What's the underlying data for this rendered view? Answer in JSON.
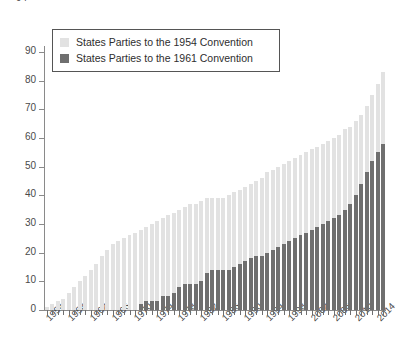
{
  "chart_data": {
    "type": "bar",
    "barmode": "stacked",
    "title": "",
    "xlabel": "",
    "ylabel": "",
    "ylim": [
      0,
      90
    ],
    "yticks": [
      0,
      10,
      20,
      30,
      40,
      50,
      60,
      70,
      80,
      90
    ],
    "y_axis_clipped_top_label": "94",
    "grid": false,
    "legend_position": "top-left",
    "colors": {
      "series_1954": "#e2e2e2",
      "series_1961": "#6f6f6f",
      "axis": "#8a8a8a",
      "text": "#3a3a3a"
    },
    "x": [
      1954,
      1955,
      1956,
      1957,
      1958,
      1959,
      1960,
      1961,
      1962,
      1963,
      1964,
      1965,
      1966,
      1967,
      1968,
      1969,
      1970,
      1971,
      1972,
      1973,
      1974,
      1975,
      1976,
      1977,
      1978,
      1979,
      1980,
      1981,
      1982,
      1983,
      1984,
      1985,
      1986,
      1987,
      1988,
      1989,
      1990,
      1991,
      1992,
      1993,
      1994,
      1995,
      1996,
      1997,
      1998,
      1999,
      2000,
      2001,
      2002,
      2003,
      2004,
      2005,
      2006,
      2007,
      2008,
      2009,
      2010,
      2011,
      2012,
      2013,
      2014,
      2015
    ],
    "xtick_labels": [
      "1954",
      "1958",
      "1962",
      "1966",
      "1970",
      "1974",
      "1978",
      "1982",
      "1986",
      "1990",
      "1994",
      "1998",
      "2002",
      "2006",
      "2010",
      "2014"
    ],
    "xtick_values": [
      1954,
      1958,
      1962,
      1966,
      1970,
      1974,
      1978,
      1982,
      1986,
      1990,
      1994,
      1998,
      2002,
      2006,
      2010,
      2014
    ],
    "series": [
      {
        "name": "States Parties to the 1961 Convention",
        "color": "#6f6f6f",
        "values": [
          0,
          0,
          0,
          0,
          0,
          0,
          0,
          0,
          0,
          0,
          0,
          0,
          0,
          0,
          0,
          0,
          0,
          2,
          3,
          3,
          3,
          5,
          5,
          6,
          8,
          9,
          9,
          9,
          10,
          13,
          14,
          14,
          14,
          14,
          15,
          16,
          17,
          18,
          19,
          19,
          20,
          21,
          22,
          23,
          24,
          25,
          26,
          27,
          28,
          29,
          30,
          31,
          32,
          33,
          35,
          37,
          40,
          44,
          48,
          52,
          55,
          58
        ]
      },
      {
        "name": "States Parties to the 1954 Convention",
        "color": "#e2e2e2",
        "values": [
          1,
          2,
          3,
          4,
          6,
          8,
          10,
          12,
          14,
          16,
          19,
          21,
          23,
          24,
          25,
          26,
          27,
          26,
          26,
          27,
          28,
          27,
          28,
          28,
          27,
          27,
          28,
          28,
          28,
          26,
          25,
          25,
          25,
          26,
          26,
          26,
          26,
          26,
          26,
          27,
          28,
          28,
          28,
          28,
          28,
          28,
          28,
          28,
          28,
          28,
          28,
          28,
          28,
          28,
          28,
          27,
          26,
          24,
          23,
          23,
          24,
          25
        ]
      }
    ],
    "totals": [
      1,
      2,
      3,
      4,
      6,
      8,
      10,
      12,
      14,
      16,
      19,
      21,
      23,
      24,
      25,
      26,
      27,
      28,
      29,
      30,
      31,
      32,
      33,
      34,
      35,
      36,
      37,
      37,
      38,
      39,
      39,
      39,
      39,
      40,
      41,
      42,
      43,
      44,
      45,
      46,
      48,
      49,
      50,
      51,
      52,
      53,
      54,
      55,
      56,
      57,
      58,
      59,
      60,
      61,
      63,
      64,
      66,
      68,
      71,
      75,
      79,
      83
    ]
  },
  "legend": {
    "items": [
      {
        "label": "States Parties to the 1954 Convention",
        "color": "#e2e2e2"
      },
      {
        "label": "States Parties to the 1961 Convention",
        "color": "#6f6f6f"
      }
    ]
  }
}
